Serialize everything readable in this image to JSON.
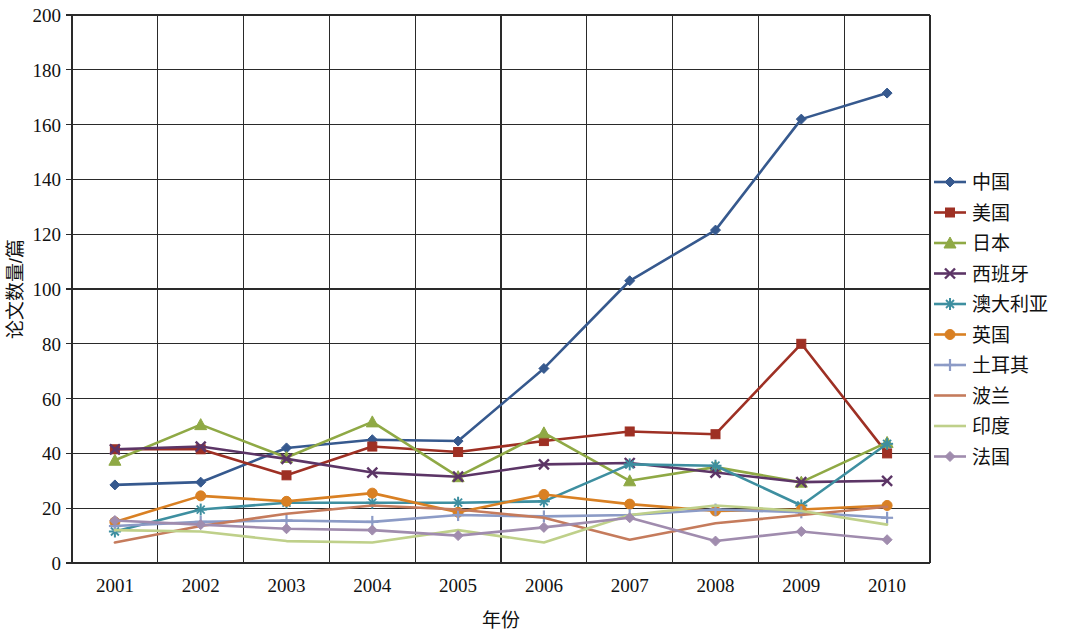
{
  "chart_data": {
    "type": "line",
    "title": "",
    "xlabel": "年份",
    "ylabel": "论文数量/篇",
    "categories": [
      "2001",
      "2002",
      "2003",
      "2004",
      "2005",
      "2006",
      "2007",
      "2008",
      "2009",
      "2010"
    ],
    "x": [
      2001,
      2002,
      2003,
      2004,
      2005,
      2006,
      2007,
      2008,
      2009,
      2010
    ],
    "xlim": [
      2001,
      2010
    ],
    "ylim": [
      0,
      200
    ],
    "y_ticks": [
      0,
      20,
      40,
      60,
      80,
      100,
      120,
      140,
      160,
      180,
      200
    ],
    "x_ticks": [
      "2001",
      "2002",
      "2003",
      "2004",
      "2005",
      "2006",
      "2007",
      "2008",
      "2009",
      "2010"
    ],
    "grid": true,
    "legend_position": "right",
    "series": [
      {
        "name": "中国",
        "color": "#36598E",
        "marker": "diamond",
        "values": [
          28.5,
          29.5,
          42,
          45,
          44.5,
          71,
          103,
          121.5,
          162,
          171.5
        ]
      },
      {
        "name": "美国",
        "color": "#9E3024",
        "marker": "square",
        "values": [
          41.5,
          41.5,
          32,
          42.5,
          40.5,
          44.5,
          48,
          47,
          80,
          40
        ]
      },
      {
        "name": "日本",
        "color": "#8FA945",
        "marker": "triangle",
        "values": [
          37.5,
          50.5,
          38.5,
          51.5,
          31.5,
          47.5,
          30,
          35,
          29.5,
          44
        ]
      },
      {
        "name": "西班牙",
        "color": "#5C3566",
        "marker": "cross",
        "values": [
          41.5,
          42.5,
          38,
          33,
          31.5,
          36,
          36.5,
          33,
          29.5,
          30
        ]
      },
      {
        "name": "澳大利亚",
        "color": "#3E8FA0",
        "marker": "star",
        "values": [
          11.5,
          19.5,
          22,
          22,
          22,
          22.5,
          36,
          35.5,
          21,
          43.5
        ]
      },
      {
        "name": "英国",
        "color": "#D98023",
        "marker": "circle",
        "values": [
          15,
          24.5,
          22.5,
          25.5,
          18.5,
          25,
          21.5,
          19,
          19.5,
          21
        ]
      },
      {
        "name": "土耳其",
        "color": "#8C9BC6",
        "marker": "plus",
        "values": [
          13.5,
          15,
          15.5,
          15,
          17.5,
          17,
          17.5,
          19.5,
          18.5,
          16.5
        ]
      },
      {
        "name": "波兰",
        "color": "#C57B5C",
        "marker": "none",
        "values": [
          7.5,
          13.5,
          18,
          21,
          19.5,
          16.5,
          8.5,
          14.5,
          17.5,
          20.5
        ]
      },
      {
        "name": "印度",
        "color": "#BFD08A",
        "marker": "none",
        "values": [
          12,
          11.5,
          8,
          7.5,
          12,
          7.5,
          17.5,
          21,
          19,
          14
        ]
      },
      {
        "name": "法国",
        "color": "#A08CAE",
        "marker": "diamond",
        "values": [
          15.5,
          14,
          12.5,
          12,
          10,
          13,
          16.5,
          8,
          11.5,
          8.5
        ]
      }
    ]
  }
}
